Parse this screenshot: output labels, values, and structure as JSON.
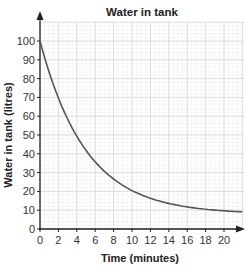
{
  "chart_data": {
    "type": "line",
    "title": "Water in tank",
    "xlabel": "Time (minutes)",
    "ylabel": "Water in tank (litres)",
    "xlim": [
      0,
      22
    ],
    "ylim": [
      0,
      100
    ],
    "x_ticks": [
      0,
      2,
      4,
      6,
      8,
      10,
      12,
      14,
      16,
      18,
      20
    ],
    "y_ticks": [
      0,
      10,
      20,
      30,
      40,
      50,
      60,
      70,
      80,
      90,
      100
    ],
    "grid": true,
    "legend": null,
    "series": [
      {
        "name": "Water in tank",
        "color": "#555555",
        "x": [
          0,
          1,
          2,
          3,
          4,
          5,
          6,
          7,
          8,
          9,
          10,
          11,
          12,
          13,
          14,
          15,
          16,
          17,
          18,
          19,
          20,
          21,
          22
        ],
        "values": [
          100,
          83.3,
          69.7,
          58.5,
          49.3,
          41.8,
          35.7,
          30.6,
          26.6,
          23.1,
          20.5,
          18.2,
          16.4,
          15,
          13.6,
          12.6,
          11.8,
          11.1,
          10.5,
          10,
          9.7,
          9.4,
          8
        ]
      }
    ]
  }
}
